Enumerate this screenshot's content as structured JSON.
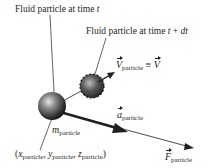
{
  "diagram": {
    "labels": {
      "particle_t": {
        "text": "Fluid particle at time ",
        "var": "t"
      },
      "particle_t_dt": {
        "text": "Fluid particle at time ",
        "var": "t",
        "op": " + ",
        "var2": "dt"
      },
      "velocity": {
        "symbol": "V",
        "subscript": "particle",
        "equiv": " ≡ ",
        "rhs": "V"
      },
      "acceleration": {
        "symbol": "a",
        "subscript": "particle"
      },
      "mass": {
        "symbol": "m",
        "subscript": "particle"
      },
      "position": {
        "open": "(",
        "x": "x",
        "y": "y",
        "z": "z",
        "subscript": "particle",
        "sep": ", ",
        "close": ")"
      },
      "force": {
        "symbol": "F",
        "subscript": "particle"
      }
    },
    "colors": {
      "ink": "#231f20",
      "sphere_light": "#d9d9d9",
      "sphere_dark": "#1a1a1a",
      "background": "#ffffff"
    }
  }
}
